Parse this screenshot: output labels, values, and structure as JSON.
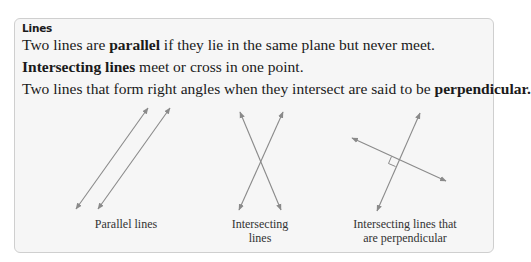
{
  "box": {
    "heading": "Lines",
    "sentences": [
      {
        "pre": "Two lines are ",
        "bold": "parallel",
        "post": " if they lie in the same plane but never meet."
      },
      {
        "pre": "",
        "bold": "Intersecting lines",
        "post": " meet or cross in one point."
      },
      {
        "pre": "Two lines that form right angles when they intersect are said to be ",
        "bold": "perpendicular.",
        "post": ""
      }
    ]
  },
  "figures": [
    {
      "caption_line1": "Parallel lines",
      "caption_line2": ""
    },
    {
      "caption_line1": "Intersecting",
      "caption_line2": "lines"
    },
    {
      "caption_line1": "Intersecting lines that",
      "caption_line2": "are perpendicular"
    }
  ],
  "colors": {
    "line": "#8a8a8a",
    "box_bg": "#f6f6f6",
    "box_border": "#cfcfcf"
  }
}
